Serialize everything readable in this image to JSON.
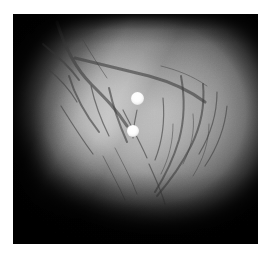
{
  "image": {
    "kind": "otoscopic-photograph",
    "subject": "tympanic membrane with vascular network",
    "modality": "grayscale endoscopic still",
    "canvas": {
      "width_px": 270,
      "height_px": 257
    },
    "border": {
      "name": "white-paper-margin",
      "color": "#ffffff",
      "left_px": 13,
      "top_px": 14,
      "right_px": 12,
      "bottom_px": 13
    },
    "plate": {
      "name": "photographic-plate",
      "x_px": 13,
      "y_px": 14,
      "width_px": 245,
      "height_px": 230,
      "background_color": "#050505"
    },
    "palette": {
      "background_black": "#050505",
      "vignette_black": "#0b0b0b",
      "shadow_gray": "#3a3a3a",
      "mid_gray": "#8d8d8d",
      "tissue_gray": "#a2a2a2",
      "highlight_gray": "#b2b2b2",
      "brightest_gray": "#bdbdbd",
      "vessel_stroke": "#3d3d3d",
      "specular_white": "#ffffff"
    },
    "illumination": {
      "name": "aperture-light-falloff",
      "center_x_pct": 58,
      "center_y_pct": 42,
      "shape": "ellipse",
      "vignette": "strong lower-left wedge and full corner falloff"
    },
    "specular_highlights": [
      {
        "name": "specular-highlight-upper",
        "center_x_px": 137,
        "center_y_px": 98,
        "diameter_px": 13,
        "color": "#ffffff"
      },
      {
        "name": "specular-highlight-lower",
        "center_x_px": 133,
        "center_y_px": 131,
        "diameter_px": 12,
        "color": "#ffffff"
      }
    ],
    "features": [
      {
        "name": "vascular-network-upper-left",
        "description": "branching major vessels arcing from upper-left toward centre"
      },
      {
        "name": "vascular-network-right",
        "description": "dense fine radial vessels fanning down the right field"
      },
      {
        "name": "tissue-fold",
        "description": "diagonal membrane ridge from upper-left to lower-right"
      },
      {
        "name": "shadowed-wedge-lower-left",
        "description": "deeply vignetted lower-left corner"
      }
    ]
  }
}
